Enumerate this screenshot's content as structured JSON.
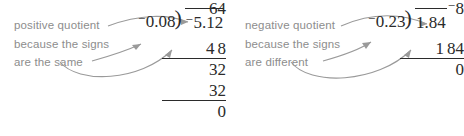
{
  "background_color": "#ffffff",
  "caption_color": "#8d8d8d",
  "math_color": "#2b2b2b",
  "arrow_color": "#9a9a9a",
  "panels": [
    {
      "id": "left",
      "caption": {
        "line1": "positive quotient",
        "line2": "because the signs",
        "line3": "are the same"
      },
      "division": {
        "quotient_sign": "",
        "quotient": "64",
        "divisor_sign": "−",
        "divisor": "0.08",
        "dividend_sign": "−",
        "dividend": "5.12",
        "work": [
          {
            "text": "4",
            "text2": "8",
            "ruled": true
          },
          {
            "text": "",
            "text2": "32",
            "ruled": false
          },
          {
            "text": "",
            "text2": "32",
            "ruled": true
          },
          {
            "text": "",
            "text2": "0",
            "ruled": false
          }
        ]
      }
    },
    {
      "id": "right",
      "caption": {
        "line1": "negative  quotient",
        "line2": "because the signs",
        "line3": "are different"
      },
      "division": {
        "quotient_sign": "−",
        "quotient": "8",
        "divisor_sign": "−",
        "divisor": "0.23",
        "dividend_sign": "",
        "dividend": "1.84",
        "work": [
          {
            "text": "1",
            "text2": "84",
            "ruled": true
          },
          {
            "text": "",
            "text2": "0",
            "ruled": false
          }
        ]
      }
    }
  ]
}
